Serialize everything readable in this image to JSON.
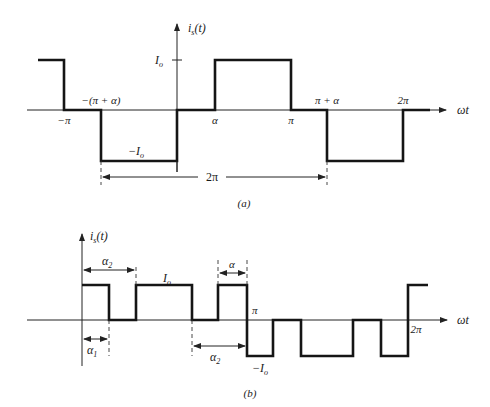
{
  "figure": {
    "panel_a": {
      "caption": "(a)",
      "y_axis_label": "i_s(t)",
      "y_axis_label_main": "i",
      "y_axis_label_sub": "s",
      "y_axis_label_arg": "(t)",
      "x_axis_label": "ωt",
      "level_high_label": "I",
      "level_high_sub": "o",
      "level_low_label": "−I",
      "level_low_sub": "o",
      "tick_labels": {
        "neg_pi": "−π",
        "neg_pi_plus_alpha": "−(π + α)",
        "alpha": "α",
        "pi": "π",
        "pi_plus_alpha": "π + α",
        "two_pi": "2π"
      },
      "period_label": "2π",
      "waveform": {
        "description": "Quasi-square wave with zero intervals of width α",
        "segments": [
          {
            "from": "-(π+α)-ish",
            "level": "+Io"
          },
          {
            "from": "−π",
            "to": "−(π+α)",
            "level": "0"
          },
          {
            "from": "−(π+α)",
            "to": "0",
            "level": "−Io"
          },
          {
            "from": "0",
            "to": "α",
            "level": "0"
          },
          {
            "from": "α",
            "to": "π",
            "level": "+Io"
          },
          {
            "from": "π",
            "to": "π+α",
            "level": "0"
          },
          {
            "from": "π+α",
            "to": "2π",
            "level": "−Io"
          },
          {
            "from": "2π",
            "level": "0"
          }
        ]
      }
    },
    "panel_b": {
      "caption": "(b)",
      "y_axis_label_main": "i",
      "y_axis_label_sub": "s",
      "y_axis_label_arg": "(t)",
      "x_axis_label": "ωt",
      "level_high_label": "I",
      "level_high_sub": "o",
      "level_low_label": "−I",
      "level_low_sub": "o",
      "tick_labels": {
        "pi": "π",
        "two_pi": "2π"
      },
      "dimension_labels": {
        "alpha1_main": "α",
        "alpha1_sub": "1",
        "alpha2_top_main": "α",
        "alpha2_top_sub": "2",
        "alpha": "α",
        "alpha2_bottom_main": "α",
        "alpha2_bottom_sub": "2"
      },
      "waveform": {
        "description": "Multi-pulse (PWM-like) quasi-square current with notches at α1, α2"
      }
    }
  }
}
